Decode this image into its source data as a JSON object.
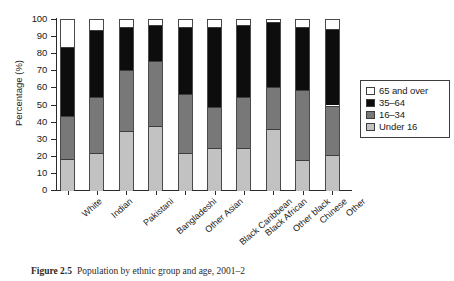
{
  "chart_data": {
    "type": "bar",
    "subtype": "stacked-percentage-column",
    "title": "Population by ethnic group and age, 2001–2",
    "xlabel": "",
    "ylabel": "Percentage (%)",
    "ylim": [
      0,
      100
    ],
    "ytick_labels": [
      "0",
      "10",
      "20",
      "30",
      "40",
      "50",
      "60",
      "70",
      "80",
      "90",
      "100"
    ],
    "ytick_values": [
      0,
      10,
      20,
      30,
      40,
      50,
      60,
      70,
      80,
      90,
      100
    ],
    "grid": false,
    "legend_position": "right",
    "categories": [
      "White",
      "Indian",
      "Pakistani",
      "Bangladeshi",
      "Other Asian",
      "Black Caribbean",
      "Black African",
      "Other black",
      "Chinese",
      "Other"
    ],
    "series": [
      {
        "name": "Under 16",
        "color": "#c2c2c2",
        "values": [
          19,
          22,
          35,
          38,
          22,
          25,
          25,
          36,
          18,
          21
        ]
      },
      {
        "name": "16–34",
        "color": "#787878",
        "values": [
          25,
          33,
          36,
          38,
          35,
          24,
          30,
          25,
          41,
          29
        ]
      },
      {
        "name": "35–64",
        "color": "#0d0d0d",
        "values": [
          40,
          39,
          25,
          21,
          39,
          47,
          42,
          38,
          37,
          45
        ]
      },
      {
        "name": "65 and over",
        "color": "#ffffff",
        "values": [
          16,
          6,
          4,
          3,
          4,
          4,
          3,
          1,
          4,
          5
        ]
      }
    ],
    "cumulative_tops": [
      [
        19,
        44,
        84,
        100
      ],
      [
        22,
        55,
        94,
        100
      ],
      [
        35,
        71,
        96,
        100
      ],
      [
        38,
        76,
        97,
        100
      ],
      [
        22,
        57,
        96,
        100
      ],
      [
        25,
        49,
        96,
        100
      ],
      [
        25,
        55,
        97,
        100
      ],
      [
        36,
        61,
        99,
        100
      ],
      [
        18,
        59,
        96,
        100
      ],
      [
        21,
        50,
        95,
        100
      ]
    ]
  },
  "legend": {
    "items": [
      {
        "label": "65 and over",
        "swatch": "#ffffff"
      },
      {
        "label": "35–64",
        "swatch": "#0d0d0d"
      },
      {
        "label": "16–34",
        "swatch": "#787878"
      },
      {
        "label": "Under 16",
        "swatch": "#c2c2c2"
      }
    ]
  },
  "caption": {
    "figure_label": "Figure 2.5",
    "figure_text": "Population by ethnic group and age, 2001–2"
  }
}
